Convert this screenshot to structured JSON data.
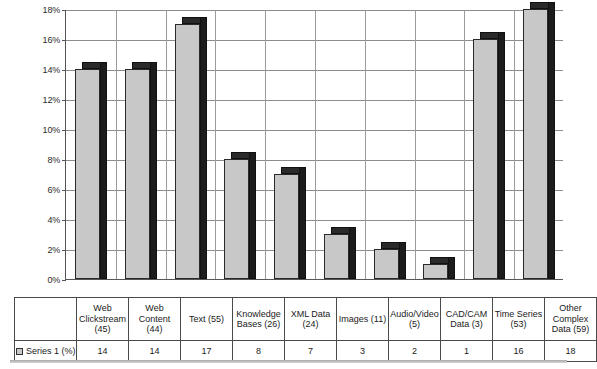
{
  "chart_data": {
    "type": "bar",
    "title": "",
    "subtitle": "",
    "xlabel": "",
    "ylabel": "",
    "ylim": [
      0,
      18
    ],
    "ytick_labels": [
      "18%",
      "16%",
      "14%",
      "12%",
      "10%",
      "8%",
      "6%",
      "4%",
      "2%",
      "0%"
    ],
    "ytick_values": [
      18,
      16,
      14,
      12,
      10,
      8,
      6,
      4,
      2,
      0
    ],
    "grid": true,
    "legend_position": "bottom-left",
    "categories": [
      "Web Clickstream (45)",
      "Web Content (44)",
      "Text (55)",
      "Knowledge Bases (26)",
      "XML Data (24)",
      "Images (11)",
      "Audio/Video (5)",
      "CAD/CAM Data (3)",
      "Time Series (53)",
      "Other Complex Data (59)"
    ],
    "series": [
      {
        "name": "Series 1 (%)",
        "values": [
          14,
          14,
          17,
          8,
          7,
          3,
          2,
          1,
          16,
          18
        ]
      }
    ],
    "colors": {
      "bar_front": "#c8c8c8",
      "bar_shade": "#1c1c1c",
      "gridline": "#8c8c8c",
      "axis": "#555555",
      "plot_background": "#ffffff"
    }
  },
  "table": {
    "header_row": [
      "Web Clickstream (45)",
      "Web Content (44)",
      "Text (55)",
      "Knowledge Bases (26)",
      "XML Data (24)",
      "Images (11)",
      "Audio/Video (5)",
      "CAD/CAM Data (3)",
      "Time Series (53)",
      "Other Complex Data (59)"
    ],
    "legend_label": "Series 1 (%)",
    "value_row": [
      "14",
      "14",
      "17",
      "8",
      "7",
      "3",
      "2",
      "1",
      "16",
      "18"
    ]
  }
}
